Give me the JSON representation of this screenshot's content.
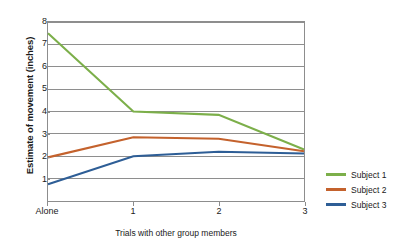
{
  "chart_data": {
    "type": "line",
    "title": "",
    "xlabel": "Trials with other group members",
    "ylabel": "Estimate of movement (inches)",
    "categories": [
      "Alone",
      "1",
      "2",
      "3"
    ],
    "xtick_labels": [
      "Alone",
      "1",
      "2",
      "3"
    ],
    "ytick_labels": [
      "8",
      "7",
      "6",
      "5",
      "4",
      "3",
      "2",
      "1"
    ],
    "ylim": [
      0,
      8
    ],
    "xlim": [
      0,
      3
    ],
    "grid": "horizontal",
    "legend_position": "right",
    "series": [
      {
        "name": "Subject 1",
        "color": "#7CAF4A",
        "values": [
          7.5,
          4.0,
          3.85,
          2.3
        ]
      },
      {
        "name": "Subject 2",
        "color": "#C4622D",
        "values": [
          1.95,
          2.85,
          2.78,
          2.22
        ]
      },
      {
        "name": "Subject 3",
        "color": "#2E5E96",
        "values": [
          0.75,
          2.0,
          2.2,
          2.12
        ]
      }
    ]
  },
  "legend": {
    "items": [
      {
        "label": "Subject 1",
        "color": "#7CAF4A"
      },
      {
        "label": "Subject 2",
        "color": "#C4622D"
      },
      {
        "label": "Subject 3",
        "color": "#2E5E96"
      }
    ]
  }
}
